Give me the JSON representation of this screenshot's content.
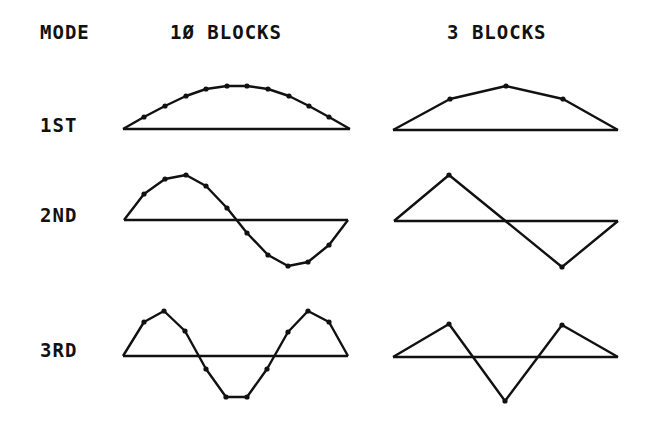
{
  "headers": {
    "mode": "MODE",
    "col_10": "1Ø BLOCKS",
    "col_3": "3 BLOCKS"
  },
  "rows": [
    {
      "label": "1ST"
    },
    {
      "label": "2ND"
    },
    {
      "label": "3RD"
    }
  ],
  "colors": {
    "ink": "#111111",
    "background": "#ffffff"
  },
  "chart_data": {
    "type": "line",
    "columns": [
      "10 BLOCKS",
      "3 BLOCKS"
    ],
    "modes": [
      "1ST",
      "2ND",
      "3RD"
    ],
    "series": [
      {
        "name": "1ST / 10 BLOCKS",
        "baseline": [
          [
            123,
            129
          ],
          [
            350,
            129
          ]
        ],
        "points": [
          [
            123,
            129
          ],
          [
            144,
            117
          ],
          [
            165,
            106
          ],
          [
            186,
            96
          ],
          [
            206,
            89
          ],
          [
            227,
            86
          ],
          [
            247,
            86
          ],
          [
            268,
            89
          ],
          [
            289,
            96
          ],
          [
            309,
            106
          ],
          [
            329,
            117
          ],
          [
            350,
            129
          ]
        ]
      },
      {
        "name": "1ST / 3 BLOCKS",
        "baseline": [
          [
            393,
            130
          ],
          [
            618,
            130
          ]
        ],
        "points": [
          [
            393,
            130
          ],
          [
            450,
            99
          ],
          [
            506,
            86
          ],
          [
            563,
            99
          ],
          [
            618,
            130
          ]
        ]
      },
      {
        "name": "2ND / 10 BLOCKS",
        "baseline": [
          [
            124,
            220
          ],
          [
            348,
            220
          ]
        ],
        "points": [
          [
            124,
            220
          ],
          [
            144,
            194
          ],
          [
            165,
            179
          ],
          [
            186,
            175
          ],
          [
            206,
            186
          ],
          [
            227,
            208
          ],
          [
            247,
            233
          ],
          [
            268,
            255
          ],
          [
            288,
            266
          ],
          [
            308,
            262
          ],
          [
            329,
            245
          ],
          [
            348,
            220
          ]
        ]
      },
      {
        "name": "2ND / 3 BLOCKS",
        "baseline": [
          [
            394,
            221
          ],
          [
            618,
            221
          ]
        ],
        "points": [
          [
            394,
            221
          ],
          [
            449,
            175
          ],
          [
            562,
            267
          ],
          [
            618,
            221
          ]
        ]
      },
      {
        "name": "3RD / 10 BLOCKS",
        "baseline": [
          [
            123,
            356
          ],
          [
            348,
            356
          ]
        ],
        "points": [
          [
            123,
            356
          ],
          [
            144,
            322
          ],
          [
            164,
            311
          ],
          [
            185,
            331
          ],
          [
            206,
            369
          ],
          [
            226,
            397
          ],
          [
            247,
            397
          ],
          [
            267,
            369
          ],
          [
            288,
            332
          ],
          [
            308,
            311
          ],
          [
            329,
            322
          ],
          [
            348,
            356
          ]
        ]
      },
      {
        "name": "3RD / 3 BLOCKS",
        "baseline": [
          [
            393,
            357
          ],
          [
            618,
            357
          ]
        ],
        "points": [
          [
            393,
            357
          ],
          [
            449,
            324
          ],
          [
            505,
            401
          ],
          [
            562,
            325
          ],
          [
            618,
            357
          ]
        ]
      }
    ]
  }
}
